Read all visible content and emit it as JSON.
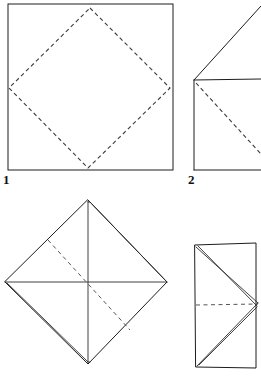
{
  "document": {
    "kind": "origami-instruction-diagram",
    "title": "Origami folding steps",
    "background_color": "#ffffff",
    "line_color": "#1c1c1c",
    "crease_color": "#3a3a3a",
    "width": 261,
    "height": 376
  },
  "steps": [
    {
      "number": "1",
      "label": "1",
      "shape": "square",
      "description": "Square sheet with dashed diamond crease joining edge midpoints",
      "solid_outline": [
        [
          8,
          4
        ],
        [
          173,
          4
        ],
        [
          173,
          170
        ],
        [
          8,
          170
        ]
      ],
      "dashed_creases": [
        [
          [
            90,
            8
          ],
          [
            170,
            88
          ]
        ],
        [
          [
            170,
            88
          ],
          [
            88,
            168
          ]
        ],
        [
          [
            88,
            168
          ],
          [
            9,
            88
          ]
        ],
        [
          [
            9,
            88
          ],
          [
            90,
            8
          ]
        ]
      ]
    },
    {
      "number": "2",
      "label": "2",
      "shape": "folded-flap-rectangle",
      "description": "Rectangle with a flap folded up at the top left and a dashed diagonal crease",
      "solid_outline": [
        [
          194,
          80
        ],
        [
          261,
          79
        ],
        [
          261,
          170
        ],
        [
          194,
          170
        ]
      ],
      "solid_flap": [
        [
          194,
          80
        ],
        [
          261,
          6
        ]
      ],
      "dashed_creases": [
        [
          [
            196,
            83
          ],
          [
            261,
            154
          ]
        ]
      ]
    },
    {
      "number": "3",
      "label": "",
      "shape": "diamond",
      "description": "Diamond with horizontal and vertical creases and a dashed diagonal fold line",
      "solid_outline": [
        [
          88,
          200
        ],
        [
          167,
          282
        ],
        [
          88,
          364
        ],
        [
          5,
          282
        ]
      ],
      "solid_creases": [
        [
          [
            5,
            282
          ],
          [
            167,
            282
          ]
        ],
        [
          [
            88,
            200
          ],
          [
            88,
            364
          ]
        ]
      ],
      "dashed_creases": [
        [
          [
            48,
            240
          ],
          [
            130,
            330
          ]
        ]
      ]
    },
    {
      "number": "4",
      "label": "",
      "shape": "vertical-rectangle",
      "description": "Tall rectangle with triangular flaps folded from left edge to right centre and a horizontal dashed crease",
      "solid_outline": [
        [
          195,
          245
        ],
        [
          256,
          243
        ],
        [
          256,
          368
        ],
        [
          196,
          367
        ]
      ],
      "solid_creases": [
        [
          [
            196,
            247
          ],
          [
            258,
            303
          ]
        ],
        [
          [
            258,
            303
          ],
          [
            197,
            366
          ]
        ],
        [
          [
            196,
            247
          ],
          [
            257,
            307
          ]
        ],
        [
          [
            257,
            307
          ],
          [
            199,
            365
          ]
        ]
      ],
      "dashed_creases": [
        [
          [
            196,
            305
          ],
          [
            258,
            304
          ]
        ]
      ]
    }
  ],
  "labels": {
    "step_one": "1",
    "step_two": "2"
  }
}
